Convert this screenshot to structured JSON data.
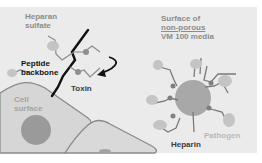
{
  "diagram": {
    "labels": {
      "heparan_sulfate": [
        "Heparan",
        "sulfate"
      ],
      "peptide_backbone": [
        "Peptide",
        "backbone"
      ],
      "toxin": "Toxin",
      "cell_surface": [
        "Cell",
        "surface"
      ],
      "media_surface": [
        "Surface of",
        "non-porous",
        "VM 100 media"
      ],
      "heparin": "Heparin",
      "pathogen": "Pathogen"
    },
    "colors": {
      "background": "#ebebeb",
      "cell_fill": "#d4d4d4",
      "cell_outline": "#8a8a8a",
      "nucleus": "#9a9a9a",
      "backbone": "#111111",
      "strand": "#7a7a7a",
      "node": "#8f8f8f",
      "blob": "#c4c4c4",
      "bead": "#a8a8a8"
    }
  }
}
